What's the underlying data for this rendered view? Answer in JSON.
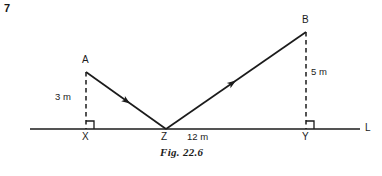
{
  "question_number": "7",
  "caption": "Fig. 22.6",
  "caption_pos": {
    "x": 160,
    "y": 152
  },
  "colors": {
    "ink": "#1b1b1b",
    "background": "#ffffff"
  },
  "figure": {
    "baseline": {
      "name": "horizontal-line-L",
      "x1": 30,
      "y1": 129,
      "x2": 360,
      "y2": 129,
      "label": "L",
      "label_pos": {
        "x": 365,
        "y": 124
      }
    },
    "points": [
      {
        "id": "A",
        "label": "A",
        "x": 86,
        "y": 72,
        "label_pos": {
          "x": 82,
          "y": 57
        }
      },
      {
        "id": "B",
        "label": "B",
        "x": 306,
        "y": 32,
        "label_pos": {
          "x": 302,
          "y": 17
        }
      },
      {
        "id": "X",
        "label": "X",
        "x": 86,
        "y": 129,
        "label_pos": {
          "x": 82,
          "y": 133
        }
      },
      {
        "id": "Y",
        "label": "Y",
        "x": 306,
        "y": 129,
        "label_pos": {
          "x": 302,
          "y": 133
        }
      },
      {
        "id": "Z",
        "label": "Z",
        "x": 166,
        "y": 129,
        "label_pos": {
          "x": 162,
          "y": 133
        }
      }
    ],
    "rays": [
      {
        "id": "A-to-Z",
        "from": "A",
        "to": "Z",
        "x1": 86,
        "y1": 72,
        "x2": 166,
        "y2": 129,
        "arrow_at": {
          "x": 128,
          "y": 102
        }
      },
      {
        "id": "Z-to-B",
        "from": "Z",
        "to": "B",
        "x1": 166,
        "y1": 129,
        "x2": 306,
        "y2": 32,
        "arrow_at": {
          "x": 233,
          "y": 83
        }
      }
    ],
    "dashed_segments": [
      {
        "id": "A-to-X",
        "x1": 86,
        "y1": 72,
        "x2": 86,
        "y2": 129,
        "measure": "3 m",
        "measure_pos": {
          "x": 55,
          "y": 92
        }
      },
      {
        "id": "B-to-Y",
        "x1": 306,
        "y1": 32,
        "x2": 306,
        "y2": 129,
        "measure": "5 m",
        "measure_pos": {
          "x": 311,
          "y": 67
        }
      }
    ],
    "right_angles": [
      {
        "id": "right-angle-at-X",
        "x": 86,
        "y": 129,
        "size": 8,
        "dir_x": 1
      },
      {
        "id": "right-angle-at-Y",
        "x": 306,
        "y": 129,
        "size": 8,
        "dir_x": 1
      }
    ],
    "base_measure": {
      "id": "Z-to-Y-distance",
      "text": "12 m",
      "pos": {
        "x": 187,
        "y": 133
      }
    }
  }
}
